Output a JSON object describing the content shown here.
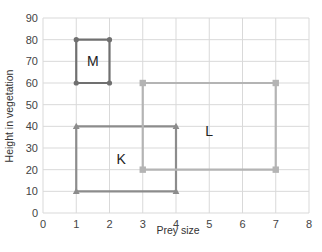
{
  "chart_data": {
    "type": "scatter",
    "title": "",
    "xlabel": "Prey size",
    "ylabel": "Height in vegetation",
    "xlim": [
      0,
      8
    ],
    "ylim": [
      0,
      90
    ],
    "x_ticks": [
      0,
      1,
      2,
      3,
      4,
      5,
      6,
      7,
      8
    ],
    "y_ticks": [
      0,
      10,
      20,
      30,
      40,
      50,
      60,
      70,
      80,
      90
    ],
    "grid": true,
    "legend": "none",
    "series": [
      {
        "name": "M",
        "label": "M",
        "color": "#707070",
        "marker": "circle",
        "points": [
          [
            1,
            60
          ],
          [
            1,
            80
          ],
          [
            2,
            80
          ],
          [
            2,
            60
          ],
          [
            1,
            60
          ]
        ],
        "label_pos": [
          1.5,
          70
        ]
      },
      {
        "name": "K",
        "label": "K",
        "color": "#8c8c8c",
        "marker": "triangle",
        "points": [
          [
            1,
            10
          ],
          [
            1,
            40
          ],
          [
            4,
            40
          ],
          [
            4,
            10
          ],
          [
            1,
            10
          ]
        ],
        "label_pos": [
          2.35,
          25
        ]
      },
      {
        "name": "L",
        "label": "L",
        "color": "#b4b4b4",
        "marker": "square",
        "points": [
          [
            3,
            20
          ],
          [
            3,
            60
          ],
          [
            7,
            60
          ],
          [
            7,
            20
          ],
          [
            3,
            20
          ]
        ],
        "label_pos": [
          5,
          38
        ]
      }
    ]
  }
}
